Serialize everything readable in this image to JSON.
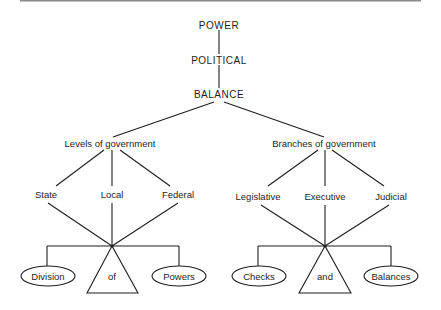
{
  "diagram": {
    "top_rule": true,
    "stack": [
      {
        "id": "power",
        "label": "POWER"
      },
      {
        "id": "political",
        "label": "POLITICAL"
      },
      {
        "id": "balance",
        "label": "BALANCE"
      }
    ],
    "branches": [
      {
        "id": "levels",
        "label": "Levels of government",
        "children": [
          {
            "label": "State"
          },
          {
            "label": "Local"
          },
          {
            "label": "Federal"
          }
        ],
        "balance_scale": {
          "left_pan": "Division",
          "fulcrum": "of",
          "right_pan": "Powers"
        }
      },
      {
        "id": "branches",
        "label": "Branches of government",
        "children": [
          {
            "label": "Legislative"
          },
          {
            "label": "Executive"
          },
          {
            "label": "Judicial"
          }
        ],
        "balance_scale": {
          "left_pan": "Checks",
          "fulcrum": "and",
          "right_pan": "Balances"
        }
      }
    ]
  }
}
